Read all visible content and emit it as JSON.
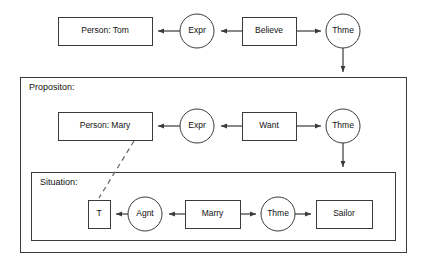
{
  "diagram": {
    "colors": {
      "stroke": "#3a3a3a",
      "fill": "#ffffff",
      "text": "#111111",
      "dashed_stroke": "#6b6b6b"
    },
    "containers": [
      {
        "id": "proposition",
        "label": "Propositon:",
        "x": 20,
        "y": 77,
        "width": 386,
        "height": 175
      },
      {
        "id": "situation",
        "label": "Situation:",
        "x": 31,
        "y": 172,
        "width": 364,
        "height": 68
      }
    ],
    "nodes": [
      {
        "id": "person-tom",
        "label": "Person: Tom",
        "shape": "rect",
        "x": 58,
        "y": 17,
        "width": 94,
        "height": 28,
        "row": "belief"
      },
      {
        "id": "expr-top",
        "label": "Expr",
        "shape": "circle",
        "cx": 197,
        "cy": 31,
        "r": 17,
        "row": "belief"
      },
      {
        "id": "believe",
        "label": "Believe",
        "shape": "rect",
        "x": 242,
        "y": 17,
        "width": 54,
        "height": 28,
        "row": "belief"
      },
      {
        "id": "thme-top",
        "label": "Thme",
        "shape": "circle",
        "cx": 343,
        "cy": 31,
        "r": 17,
        "row": "belief"
      },
      {
        "id": "person-mary",
        "label": "Person: Mary",
        "shape": "rect",
        "x": 58,
        "y": 112,
        "width": 94,
        "height": 28,
        "row": "proposition"
      },
      {
        "id": "expr-mid",
        "label": "Expr",
        "shape": "circle",
        "cx": 197,
        "cy": 126,
        "r": 17,
        "row": "proposition"
      },
      {
        "id": "want",
        "label": "Want",
        "shape": "rect",
        "x": 242,
        "y": 112,
        "width": 54,
        "height": 28,
        "row": "proposition"
      },
      {
        "id": "thme-mid",
        "label": "Thme",
        "shape": "circle",
        "cx": 343,
        "cy": 126,
        "r": 17,
        "row": "proposition"
      },
      {
        "id": "t-var",
        "label": "T",
        "shape": "rect",
        "x": 88,
        "y": 200,
        "width": 22,
        "height": 28,
        "row": "situation"
      },
      {
        "id": "agnt",
        "label": "Agnt",
        "shape": "circle",
        "cx": 145,
        "cy": 214,
        "r": 17,
        "row": "situation"
      },
      {
        "id": "marry",
        "label": "Marry",
        "shape": "rect",
        "x": 185,
        "y": 200,
        "width": 55,
        "height": 28,
        "row": "situation"
      },
      {
        "id": "thme-bot",
        "label": "Thme",
        "shape": "circle",
        "cx": 278,
        "cy": 214,
        "r": 17,
        "row": "situation"
      },
      {
        "id": "sailor",
        "label": "Sailor",
        "shape": "rect",
        "x": 316,
        "y": 200,
        "width": 56,
        "height": 28,
        "row": "situation"
      }
    ],
    "edges": [
      {
        "id": "believe-to-expr-top",
        "from": "believe",
        "to": "expr-top",
        "style": "solid",
        "arrow": "end"
      },
      {
        "id": "expr-top-to-tom",
        "from": "expr-top",
        "to": "person-tom",
        "style": "solid",
        "arrow": "end"
      },
      {
        "id": "believe-to-thme-top",
        "from": "believe",
        "to": "thme-top",
        "style": "solid",
        "arrow": "end"
      },
      {
        "id": "thme-top-to-proposition",
        "from": "thme-top",
        "to": "proposition",
        "style": "solid",
        "arrow": "end"
      },
      {
        "id": "want-to-expr-mid",
        "from": "want",
        "to": "expr-mid",
        "style": "solid",
        "arrow": "end"
      },
      {
        "id": "expr-mid-to-mary",
        "from": "expr-mid",
        "to": "person-mary",
        "style": "solid",
        "arrow": "end"
      },
      {
        "id": "want-to-thme-mid",
        "from": "want",
        "to": "thme-mid",
        "style": "solid",
        "arrow": "end"
      },
      {
        "id": "thme-mid-to-situation",
        "from": "thme-mid",
        "to": "situation",
        "style": "solid",
        "arrow": "end"
      },
      {
        "id": "marry-to-agnt",
        "from": "marry",
        "to": "agnt",
        "style": "solid",
        "arrow": "end"
      },
      {
        "id": "agnt-to-t",
        "from": "agnt",
        "to": "t-var",
        "style": "solid",
        "arrow": "end"
      },
      {
        "id": "marry-to-thme-bot",
        "from": "marry",
        "to": "thme-bot",
        "style": "solid",
        "arrow": "end"
      },
      {
        "id": "thme-bot-to-sailor",
        "from": "thme-bot",
        "to": "sailor",
        "style": "solid",
        "arrow": "end"
      },
      {
        "id": "mary-to-t-coref",
        "from": "person-mary",
        "to": "t-var",
        "style": "dashed",
        "arrow": "none"
      }
    ]
  }
}
